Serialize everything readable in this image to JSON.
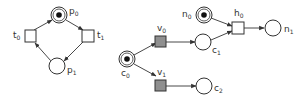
{
  "diagram": {
    "type": "petri-net",
    "colors": {
      "stroke": "#333333",
      "filled_transition": "#8f8f8f",
      "token": "#111111"
    },
    "left_net": {
      "places": [
        {
          "id": "p0",
          "label": "p",
          "sub": "0",
          "marked": true
        },
        {
          "id": "p1",
          "label": "p",
          "sub": "1",
          "marked": false
        }
      ],
      "transitions": [
        {
          "id": "t0",
          "label": "t",
          "sub": "0",
          "filled": false
        },
        {
          "id": "t1",
          "label": "t",
          "sub": "1",
          "filled": false
        }
      ],
      "arcs": [
        [
          "t0",
          "p0"
        ],
        [
          "p0",
          "t1"
        ],
        [
          "t1",
          "p1"
        ],
        [
          "p1",
          "t0"
        ]
      ]
    },
    "right_net": {
      "places": [
        {
          "id": "c0",
          "label": "c",
          "sub": "0",
          "marked": true
        },
        {
          "id": "c1",
          "label": "c",
          "sub": "1",
          "marked": false
        },
        {
          "id": "c2",
          "label": "c",
          "sub": "2",
          "marked": false
        },
        {
          "id": "n0",
          "label": "n",
          "sub": "0",
          "marked": true
        },
        {
          "id": "n1",
          "label": "n",
          "sub": "1",
          "marked": false
        }
      ],
      "transitions": [
        {
          "id": "v0",
          "label": "v",
          "sub": "0",
          "filled": true
        },
        {
          "id": "v1",
          "label": "v",
          "sub": "1",
          "filled": true
        },
        {
          "id": "h0",
          "label": "h",
          "sub": "0",
          "filled": false
        }
      ],
      "arcs": [
        [
          "c0",
          "v0"
        ],
        [
          "c0",
          "v1"
        ],
        [
          "v0",
          "c1"
        ],
        [
          "v1",
          "c2"
        ],
        [
          "c1",
          "h0"
        ],
        [
          "n0",
          "h0"
        ],
        [
          "h0",
          "n1"
        ]
      ]
    }
  }
}
